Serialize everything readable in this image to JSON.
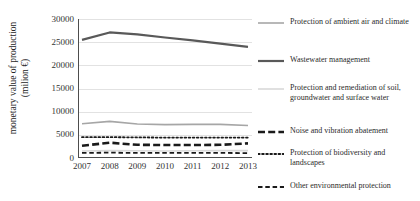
{
  "chart_data": {
    "type": "line",
    "title": "",
    "xlabel": "",
    "ylabel": "monetary value of production\n(milion €)",
    "x": [
      "2007",
      "2008",
      "2009",
      "2010",
      "2011",
      "2012",
      "2013"
    ],
    "ylim": [
      0,
      30000
    ],
    "ytick_values": [
      30000,
      25000,
      20000,
      15000,
      10000,
      5000,
      0
    ],
    "ytick_labels": [
      "30000",
      "25000",
      "20000",
      "15000",
      "10000",
      "5000",
      "0"
    ],
    "grid": true,
    "legend_position": "right",
    "series": [
      {
        "name": "Protection of ambient air and climate",
        "style": "solid",
        "color": "#a6a6a6",
        "width": 1.6,
        "values": [
          7400,
          7900,
          7350,
          7200,
          7250,
          7250,
          7000
        ]
      },
      {
        "name": "Wastewater management",
        "style": "solid",
        "color": "#595959",
        "width": 2.2,
        "values": [
          25500,
          27100,
          26700,
          26000,
          25400,
          24700,
          24000
        ]
      },
      {
        "name": "Protection and remediation of soil, groundwater and surface water",
        "style": "solid",
        "color": "#d9d9d9",
        "width": 1.6,
        "values": [
          1500,
          1600,
          1550,
          1500,
          1550,
          1600,
          1600
        ]
      },
      {
        "name": "Noise and vibration abatement",
        "style": "dashed-thick",
        "color": "#1a1a1a",
        "width": 2.6,
        "values": [
          2650,
          3300,
          2850,
          2800,
          2800,
          2850,
          3150
        ]
      },
      {
        "name": "Protection of biodiversity and landscapes",
        "style": "dotted",
        "color": "#1a1a1a",
        "width": 1.8,
        "values": [
          4500,
          4500,
          4450,
          4400,
          4400,
          4400,
          4400
        ]
      },
      {
        "name": "Other environmental protection",
        "style": "dashed",
        "color": "#1a1a1a",
        "width": 1.8,
        "values": [
          1100,
          1150,
          1100,
          1100,
          1100,
          1100,
          1050
        ]
      }
    ]
  }
}
